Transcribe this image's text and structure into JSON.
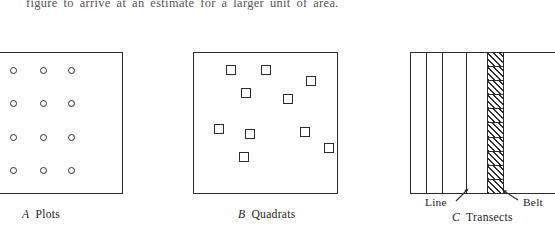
{
  "document": {
    "running_text": "figure to arrive at an estimate for a larger unit of area."
  },
  "figure": {
    "panels": [
      {
        "id": "plots",
        "caption_letter": "A",
        "caption_label": "Plots",
        "sample_unit_shape": "circle",
        "layout": "regular-grid",
        "rows": 4,
        "columns": 3,
        "count": 12
      },
      {
        "id": "quadrats",
        "caption_letter": "B",
        "caption_label": "Quadrats",
        "sample_unit_shape": "square",
        "layout": "random-scatter",
        "count": 10
      },
      {
        "id": "transects",
        "caption_letter": "C",
        "caption_label": "Transects",
        "sample_unit_shape": "vertical-line-and-belt",
        "line_count": 4,
        "belt_segments": 10,
        "annotations": [
          {
            "id": "line",
            "label": "Line",
            "arrow": "up-right"
          },
          {
            "id": "belt",
            "label": "Belt",
            "arrow": "up-left"
          }
        ]
      }
    ],
    "plot_dots": [
      {
        "x": 10,
        "y": 67
      },
      {
        "x": 40,
        "y": 67
      },
      {
        "x": 68,
        "y": 67
      },
      {
        "x": 10,
        "y": 100
      },
      {
        "x": 40,
        "y": 100
      },
      {
        "x": 68,
        "y": 100
      },
      {
        "x": 10,
        "y": 134
      },
      {
        "x": 40,
        "y": 134
      },
      {
        "x": 68,
        "y": 134
      },
      {
        "x": 10,
        "y": 167
      },
      {
        "x": 40,
        "y": 167
      },
      {
        "x": 68,
        "y": 167
      }
    ],
    "quadrat_positions": [
      {
        "x": 226,
        "y": 65
      },
      {
        "x": 261,
        "y": 65
      },
      {
        "x": 306,
        "y": 76
      },
      {
        "x": 241,
        "y": 88
      },
      {
        "x": 283,
        "y": 94
      },
      {
        "x": 214,
        "y": 124
      },
      {
        "x": 245,
        "y": 129
      },
      {
        "x": 300,
        "y": 127
      },
      {
        "x": 324,
        "y": 143
      },
      {
        "x": 239,
        "y": 152
      }
    ],
    "transect_line_positions": [
      426,
      442,
      466
    ],
    "belt_position": {
      "x": 487
    }
  },
  "colors": {
    "ink": "#2b2b2b",
    "text": "#222222",
    "running_text": "#555054",
    "paper": "#ffffff"
  }
}
